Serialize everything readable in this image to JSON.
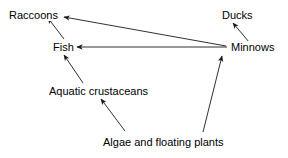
{
  "diagram": {
    "type": "food-web",
    "title": "",
    "background_color": "#ffffff",
    "line_color": "#1a1a1a",
    "text_color": "#000000",
    "nodes": [
      {
        "id": "raccoons",
        "label": "Raccoons",
        "x": 8,
        "y": 9
      },
      {
        "id": "ducks",
        "label": "Ducks",
        "x": 221,
        "y": 9
      },
      {
        "id": "fish",
        "label": "Fish",
        "x": 52,
        "y": 41
      },
      {
        "id": "minnows",
        "label": "Minnows",
        "x": 230,
        "y": 41
      },
      {
        "id": "aquatic_crustaceans",
        "label": "Aquatic crustaceans",
        "x": 48,
        "y": 85
      },
      {
        "id": "algae",
        "label": "Algae and floating plants",
        "x": 102,
        "y": 136
      }
    ],
    "edges": [
      {
        "id": "minnows-to-raccoons",
        "from": "minnows",
        "to": "raccoons",
        "x1": 226,
        "y1": 46,
        "x2": 64,
        "y2": 17
      },
      {
        "id": "minnows-to-fish",
        "from": "minnows",
        "to": "fish",
        "x1": 227,
        "y1": 47,
        "x2": 77,
        "y2": 47
      },
      {
        "id": "fish-to-raccoons",
        "from": "fish",
        "to": "raccoons",
        "x1": 64,
        "y1": 39,
        "x2": 48,
        "y2": 18
      },
      {
        "id": "aquatic-crustaceans-to-fish",
        "from": "aquatic_crustaceans",
        "to": "fish",
        "x1": 83,
        "y1": 83,
        "x2": 64,
        "y2": 55
      },
      {
        "id": "algae-to-aquatic-crustaceans",
        "from": "algae",
        "to": "aquatic_crustaceans",
        "x1": 125,
        "y1": 131,
        "x2": 101,
        "y2": 99
      },
      {
        "id": "algae-to-minnows",
        "from": "algae",
        "to": "minnows",
        "x1": 203,
        "y1": 132,
        "x2": 222,
        "y2": 56
      },
      {
        "id": "minnows-to-ducks",
        "from": "minnows",
        "to": "ducks",
        "x1": 249,
        "y1": 42,
        "x2": 233,
        "y2": 23
      }
    ]
  }
}
